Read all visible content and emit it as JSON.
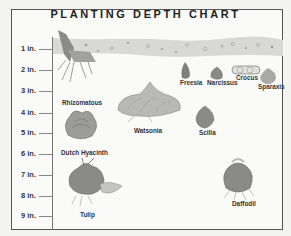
{
  "chart": {
    "title": "PLANTING DEPTH CHART",
    "depth_ticks": [
      {
        "label": "1 in.",
        "y": 44
      },
      {
        "label": "2 in.",
        "y": 65
      },
      {
        "label": "3 in.",
        "y": 86
      },
      {
        "label": "4 in.",
        "y": 108
      },
      {
        "label": "5 in.",
        "y": 128
      },
      {
        "label": "6 in.",
        "y": 149
      },
      {
        "label": "7 in.",
        "y": 170
      },
      {
        "label": "8 in.",
        "y": 191
      },
      {
        "label": "9 in.",
        "y": 211
      }
    ],
    "bulbs": [
      {
        "name": "Rhizomatous",
        "x": 62,
        "y": 99
      },
      {
        "name": "Dutch Hyacinth",
        "x": 61,
        "y": 149
      },
      {
        "name": "Watsonia",
        "x": 134,
        "y": 127
      },
      {
        "name": "Freesia",
        "x": 180,
        "y": 79
      },
      {
        "name": "Narcissus",
        "x": 207,
        "y": 79
      },
      {
        "name": "Crocus",
        "x": 236,
        "y": 74
      },
      {
        "name": "Sparaxis",
        "x": 258,
        "y": 83
      },
      {
        "name": "Scilla",
        "x": 199,
        "y": 129
      },
      {
        "name": "Tulip",
        "x": 80,
        "y": 211
      },
      {
        "name": "Daffodil",
        "x": 232,
        "y": 200
      }
    ],
    "colors": {
      "soil": "#d6d6d4",
      "bulb_dark": "#7a7a78",
      "bulb_mid": "#a8a8a6",
      "bulb_light": "#cfcfcd",
      "border": "#555555"
    }
  }
}
